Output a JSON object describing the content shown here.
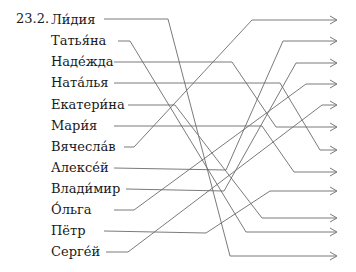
{
  "exercise": {
    "number": "23.2.",
    "names": [
      {
        "label": "Ли́дия",
        "y": 20
      },
      {
        "label": "Татья́на",
        "y": 41
      },
      {
        "label": "Наде́жда",
        "y": 62
      },
      {
        "label": "Ната́лья",
        "y": 83
      },
      {
        "label": "Екатери́на",
        "y": 105
      },
      {
        "label": "Мари́я",
        "y": 126
      },
      {
        "label": "Вячесла́в",
        "y": 147
      },
      {
        "label": "Алексе́й",
        "y": 168
      },
      {
        "label": "Влади́мир",
        "y": 189
      },
      {
        "label": "О́льга",
        "y": 210
      },
      {
        "label": "Пётр",
        "y": 231
      },
      {
        "label": "Серге́й",
        "y": 252
      }
    ],
    "arrow_targets_y": [
      20,
      41,
      63,
      84,
      105,
      127,
      150,
      172,
      191,
      218,
      232,
      256
    ],
    "line_color": "#6b6b6b"
  }
}
